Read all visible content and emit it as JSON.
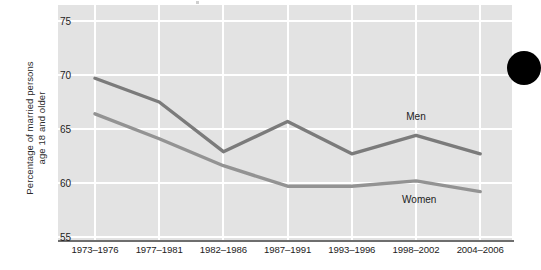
{
  "chart_data": {
    "type": "line",
    "title": "",
    "xlabel": "",
    "ylabel": "Percentage of married persons age 18 and older",
    "ylabel_line1": "Percentage of married persons",
    "ylabel_line2": "age 18 and older",
    "categories": [
      "1973–1976",
      "1977–1981",
      "1982–1986",
      "1987–1991",
      "1993–1996",
      "1998–2002",
      "2004–2006"
    ],
    "ylim": [
      55,
      75
    ],
    "yticks": [
      55,
      60,
      65,
      70,
      75
    ],
    "ytick_labels": [
      "55",
      "60",
      "65",
      "70",
      "75"
    ],
    "grid": true,
    "legend_position": "inline-annotation",
    "series": [
      {
        "name": "Men",
        "color": "#7b7b7b",
        "values": [
          69.7,
          67.5,
          62.9,
          65.7,
          62.7,
          64.4,
          62.7
        ],
        "annotation": {
          "label": "Men",
          "x_value": 5.0,
          "y_value": 66.2
        }
      },
      {
        "name": "Women",
        "color": "#939393",
        "values": [
          66.4,
          64.1,
          61.6,
          59.7,
          59.7,
          60.2,
          59.2
        ],
        "annotation": {
          "label": "Women",
          "x_value": 5.05,
          "y_value": 58.5
        }
      }
    ]
  },
  "figure": {
    "plot_background": "#e3e3e3",
    "page_background": "#ffffff",
    "gridline_color": "#ffffff",
    "axis_color": "#6e6e6e",
    "decoration": {
      "name": "page-corner-dot",
      "color": "#000000"
    }
  }
}
